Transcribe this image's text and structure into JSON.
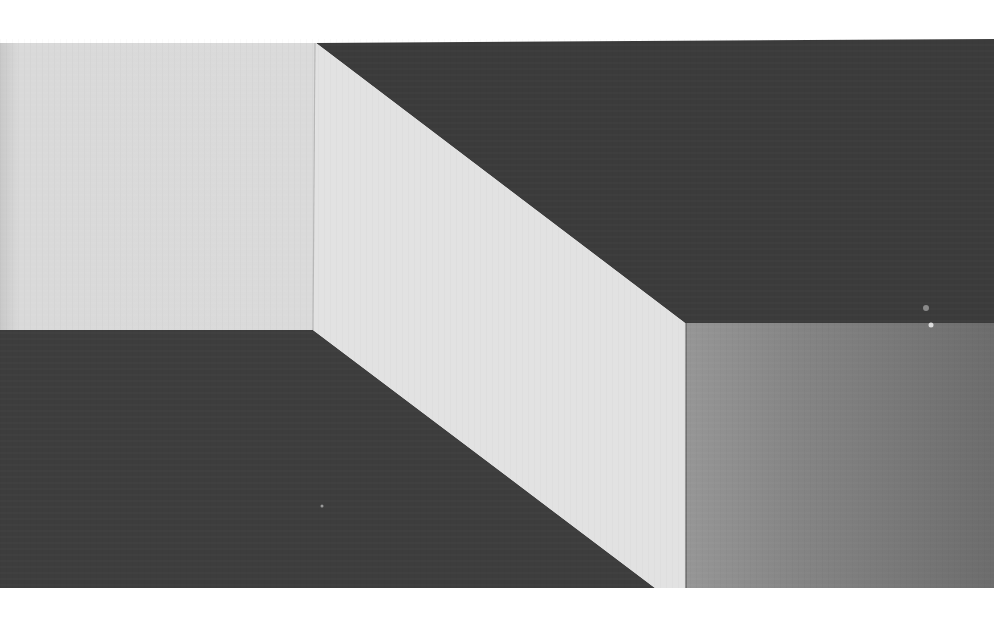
{
  "artwork": {
    "description": "Black-and-white photograph of a geometric hard-edge composition depicting a folded/stepped plane illusion",
    "colors": {
      "page_background": "#ffffff",
      "top_left_panel": "#d9d9d9",
      "center_band": "#e2e2e2",
      "top_right_panel": "#3b3b3b",
      "bottom_left_panel": "#3d3d3d",
      "bottom_right_panel_light": "#969696",
      "bottom_right_panel_dark": "#6c6c6c"
    },
    "shapes": {
      "top_left_panel": "0,43 316,43 313,330 0,330",
      "center_band": "316,43 685,323 686,588 655,588 313,330",
      "top_right_panel": "316,43 994,39 994,323 685,323",
      "bottom_left_panel": "0,330 313,330 655,588 0,588",
      "bottom_right_panel": "686,323 994,323 994,588 686,588"
    }
  }
}
